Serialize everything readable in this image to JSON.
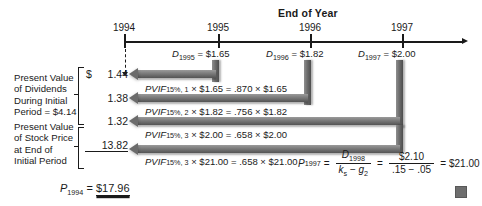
{
  "figure": {
    "title": "End of Year",
    "end_marker": "end-of-figure-square"
  },
  "timeline": {
    "years": [
      "1994",
      "1995",
      "1996",
      "1997"
    ],
    "dividends": [
      {
        "label": "D",
        "year": "1995",
        "eq": " = ",
        "value": "$1.65"
      },
      {
        "label": "D",
        "year": "1996",
        "eq": " = ",
        "value": "$1.82"
      },
      {
        "label": "D",
        "year": "1997",
        "eq": " = ",
        "value": "$2.00"
      }
    ]
  },
  "groups": {
    "dividends_label": {
      "line1": "Present Value",
      "line2": "of Dividends",
      "line3": "During Initial",
      "line4": "Period = $4.14"
    },
    "stock_price_label": {
      "line1": "Present Value",
      "line2": "of Stock Price",
      "line3": "at End of",
      "line4": "Initial Period"
    }
  },
  "rows": [
    {
      "dollar": "$",
      "amount": "1.44",
      "pvif_name": "PVIF",
      "pvif_sub": "15%, 1",
      "pvif_expr": " × $1.65 = .870 × $1.65"
    },
    {
      "dollar": "",
      "amount": "1.38",
      "pvif_name": "PVIF",
      "pvif_sub": "15%, 2",
      "pvif_expr": " × $1.82 = .756 × $1.82"
    },
    {
      "dollar": "",
      "amount": "1.32",
      "pvif_name": "PVIF",
      "pvif_sub": "15%, 3",
      "pvif_expr": " × $2.00 = .658 × $2.00"
    },
    {
      "dollar": "",
      "amount": "13.82",
      "pvif_name": "PVIF",
      "pvif_sub": "15%, 3",
      "pvif_expr": " × $21.00 = .658 × $21.00"
    }
  ],
  "terminal_value_formula": {
    "p_label": "P",
    "p_sub": "1997",
    "eq1": "=",
    "frac1_top_label": "D",
    "frac1_top_sub": "1998",
    "frac1_bot_k": "k",
    "frac1_bot_k_sub": "s",
    "frac1_bot_minus": " − ",
    "frac1_bot_g": "g",
    "frac1_bot_g_sub": "2",
    "eq2": "=",
    "frac2_top": "$2.10",
    "frac2_bot": ".15 − .05",
    "eq3": "=",
    "result": "$21.00"
  },
  "total": {
    "p_label": "P",
    "p_sub": "1994",
    "eq": " = ",
    "value": "$17.96"
  }
}
